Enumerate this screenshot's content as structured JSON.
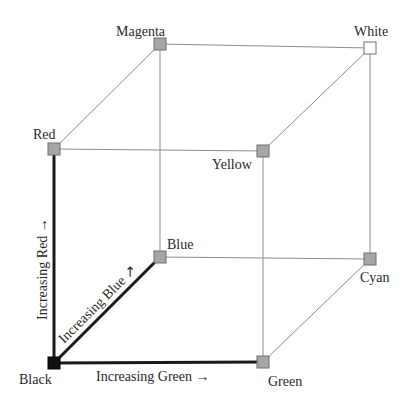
{
  "diagram": {
    "vertices": [
      {
        "id": "black",
        "label": "Black",
        "fill": "#111111"
      },
      {
        "id": "red",
        "label": "Red",
        "fill": "#a6a6a6"
      },
      {
        "id": "green",
        "label": "Green",
        "fill": "#a6a6a6"
      },
      {
        "id": "blue",
        "label": "Blue",
        "fill": "#a6a6a6"
      },
      {
        "id": "yellow",
        "label": "Yellow",
        "fill": "#a6a6a6"
      },
      {
        "id": "magenta",
        "label": "Magenta",
        "fill": "#a6a6a6"
      },
      {
        "id": "cyan",
        "label": "Cyan",
        "fill": "#a6a6a6"
      },
      {
        "id": "white",
        "label": "White",
        "fill": "#ffffff"
      }
    ],
    "axes": {
      "red": {
        "label": "Increasing Red →"
      },
      "green": {
        "label": "Increasing Green →"
      },
      "blue": {
        "label": "Increasing Blue ↗"
      }
    },
    "edges": [
      {
        "from": "black",
        "to": "red",
        "style": "axis"
      },
      {
        "from": "black",
        "to": "green",
        "style": "axis"
      },
      {
        "from": "black",
        "to": "blue",
        "style": "axis"
      },
      {
        "from": "red",
        "to": "yellow",
        "style": "thin"
      },
      {
        "from": "red",
        "to": "magenta",
        "style": "thin"
      },
      {
        "from": "green",
        "to": "yellow",
        "style": "thin"
      },
      {
        "from": "green",
        "to": "cyan",
        "style": "thin"
      },
      {
        "from": "blue",
        "to": "magenta",
        "style": "thin"
      },
      {
        "from": "blue",
        "to": "cyan",
        "style": "thin"
      },
      {
        "from": "yellow",
        "to": "white",
        "style": "thin"
      },
      {
        "from": "magenta",
        "to": "white",
        "style": "thin"
      },
      {
        "from": "cyan",
        "to": "white",
        "style": "thin"
      }
    ]
  }
}
